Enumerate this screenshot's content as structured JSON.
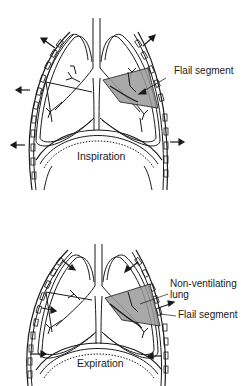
{
  "figure": {
    "panels": [
      {
        "id": "inspiration",
        "caption": "Inspiration",
        "labels": [
          "Flail segment"
        ],
        "description": "Chest wall expands outward (arrows outward); flail segment moves inward"
      },
      {
        "id": "expiration",
        "caption": "Expiration",
        "labels": [
          "Non-ventilating lung",
          "Flail segment"
        ],
        "label_lines": {
          "non_ventilating_1": "Non-ventilating",
          "non_ventilating_2": "lung"
        },
        "description": "Chest wall moves inward (arrows inward); flail segment moves outward"
      }
    ],
    "colors": {
      "line": "#1a1a1a",
      "shade": "#9a9a9a",
      "background": "#ffffff"
    }
  }
}
